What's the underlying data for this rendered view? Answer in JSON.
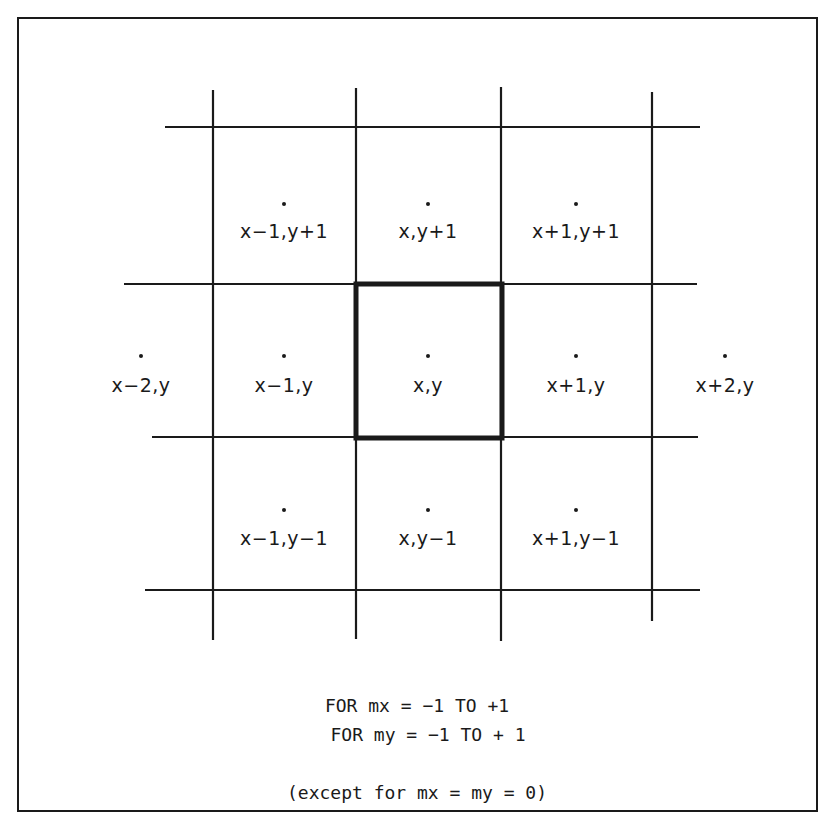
{
  "figure": {
    "kind": "neighborhood-grid-diagram",
    "border_color": "#1a1a1a",
    "line_color": "#1a1a1a",
    "highlight_color": "#1a1a1a",
    "background": "#ffffff"
  },
  "grid": {
    "vertical_lines": [
      {
        "x": 213,
        "y1": 90,
        "y2": 640
      },
      {
        "x": 356,
        "y1": 88,
        "y2": 639
      },
      {
        "x": 501,
        "y1": 87,
        "y2": 641
      },
      {
        "x": 652,
        "y1": 92,
        "y2": 621
      }
    ],
    "horizontal_lines": [
      {
        "y": 127,
        "x1": 165,
        "x2": 700
      },
      {
        "y": 284,
        "x1": 124,
        "x2": 697
      },
      {
        "y": 437,
        "x1": 152,
        "x2": 698
      },
      {
        "y": 590,
        "x1": 145,
        "x2": 700
      }
    ],
    "highlight_cell": {
      "label": "x,y",
      "x": 356,
      "y": 284,
      "width": 146,
      "height": 154,
      "stroke_width": 5
    }
  },
  "cells": [
    {
      "name": "cell-xm1-yp1",
      "label": "x−1,y+1",
      "cx": 284,
      "label_y": 222,
      "dot_x": 284,
      "dot_y": 204
    },
    {
      "name": "cell-x-yp1",
      "label": "x,y+1",
      "cx": 428,
      "label_y": 222,
      "dot_x": 428,
      "dot_y": 204
    },
    {
      "name": "cell-xp1-yp1",
      "label": "x+1,y+1",
      "cx": 576,
      "label_y": 222,
      "dot_x": 576,
      "dot_y": 204
    },
    {
      "name": "cell-xm2-y",
      "label": "x−2,y",
      "cx": 141,
      "label_y": 376,
      "dot_x": 141,
      "dot_y": 356
    },
    {
      "name": "cell-xm1-y",
      "label": "x−1,y",
      "cx": 284,
      "label_y": 376,
      "dot_x": 284,
      "dot_y": 356
    },
    {
      "name": "cell-x-y",
      "label": "x,y",
      "cx": 428,
      "label_y": 376,
      "dot_x": 428,
      "dot_y": 356
    },
    {
      "name": "cell-xp1-y",
      "label": "x+1,y",
      "cx": 576,
      "label_y": 376,
      "dot_x": 576,
      "dot_y": 356
    },
    {
      "name": "cell-xp2-y",
      "label": "x+2,y",
      "cx": 725,
      "label_y": 376,
      "dot_x": 725,
      "dot_y": 356
    },
    {
      "name": "cell-xm1-ym1",
      "label": "x−1,y−1",
      "cx": 284,
      "label_y": 529,
      "dot_x": 284,
      "dot_y": 510
    },
    {
      "name": "cell-x-ym1",
      "label": "x,y−1",
      "cx": 428,
      "label_y": 529,
      "dot_x": 428,
      "dot_y": 510
    },
    {
      "name": "cell-xp1-ym1",
      "label": "x+1,y−1",
      "cx": 576,
      "label_y": 529,
      "dot_x": 576,
      "dot_y": 510
    }
  ],
  "caption": {
    "lines": [
      {
        "name": "caption-line-for-mx",
        "text": "FOR mx = −1 TO +1",
        "cx": 417,
        "y": 697
      },
      {
        "name": "caption-line-for-my",
        "text": "FOR my = −1 TO + 1",
        "cx": 428,
        "y": 726
      },
      {
        "name": "caption-line-except",
        "text": "(except for mx = my = 0)",
        "cx": 417,
        "y": 784
      }
    ]
  }
}
